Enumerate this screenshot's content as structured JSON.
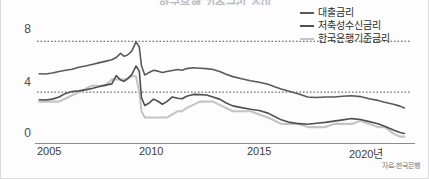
{
  "figure": {
    "title": "한국은행 기준금리 추이",
    "source_note": "자료-한국은행"
  },
  "legend": {
    "position": "top-right",
    "items": [
      {
        "label": "대출금리",
        "color": "#59595b",
        "width": 2
      },
      {
        "label": "저축성수신금리",
        "color": "#4f4f51",
        "width": 2
      },
      {
        "label": "한국은행기준금리",
        "color": "#c2c4c6",
        "width": 2
      }
    ]
  },
  "axes": {
    "y_ticks": [
      "8",
      "4",
      "0"
    ],
    "y_tick_values": [
      8,
      4,
      0
    ],
    "x_ticks": [
      "2005",
      "2010",
      "2015",
      "2020년"
    ],
    "x_tick_values": [
      2005,
      2010,
      2015,
      2020
    ],
    "ylim": [
      0,
      9.2
    ],
    "xlim": [
      2004.3,
      2021.3
    ],
    "grid": "horizontal-dotted-at-4-and-8"
  },
  "chart_data": {
    "type": "line",
    "title": "한국은행 기준금리 추이",
    "xlabel": "",
    "ylabel": "",
    "unit": "%",
    "ylim": [
      0,
      9.2
    ],
    "xlim": [
      2004.3,
      2021.3
    ],
    "grid": true,
    "legend_position": "top-right",
    "x": [
      2004.4,
      2004.7,
      2005.0,
      2005.3,
      2005.6,
      2005.9,
      2006.2,
      2006.5,
      2006.8,
      2007.1,
      2007.4,
      2007.7,
      2007.9,
      2008.1,
      2008.25,
      2008.4,
      2008.6,
      2008.8,
      2008.95,
      2009.05,
      2009.2,
      2009.4,
      2009.6,
      2009.8,
      2010.0,
      2010.2,
      2010.45,
      2010.7,
      2010.9,
      2011.1,
      2011.4,
      2011.7,
      2012.0,
      2012.3,
      2012.6,
      2012.9,
      2013.2,
      2013.6,
      2014.0,
      2014.4,
      2014.8,
      2015.1,
      2015.4,
      2015.8,
      2016.2,
      2016.6,
      2017.0,
      2017.4,
      2017.8,
      2018.2,
      2018.6,
      2019.0,
      2019.4,
      2019.8,
      2020.1,
      2020.5,
      2020.8,
      2021.0
    ],
    "series": [
      {
        "name": "대출금리",
        "color": "#59595b",
        "values": [
          5.45,
          5.42,
          5.5,
          5.62,
          5.72,
          5.8,
          5.95,
          6.05,
          6.18,
          6.3,
          6.42,
          6.55,
          6.72,
          7.05,
          6.82,
          6.9,
          7.2,
          7.95,
          7.55,
          6.05,
          5.35,
          5.55,
          5.72,
          5.65,
          5.55,
          5.62,
          5.7,
          5.78,
          5.72,
          5.85,
          5.92,
          5.88,
          5.85,
          5.78,
          5.62,
          5.4,
          5.22,
          5.05,
          4.9,
          4.78,
          4.62,
          4.42,
          4.25,
          4.05,
          3.85,
          3.62,
          3.58,
          3.62,
          3.62,
          3.68,
          3.72,
          3.65,
          3.48,
          3.35,
          3.2,
          3.05,
          2.9,
          2.75
        ]
      },
      {
        "name": "저축성수신금리",
        "color": "#4f4f51",
        "values": [
          3.4,
          3.38,
          3.45,
          3.62,
          3.9,
          4.05,
          4.1,
          4.18,
          4.28,
          4.42,
          4.55,
          4.65,
          5.3,
          4.95,
          4.85,
          5.05,
          5.35,
          6.05,
          5.65,
          3.55,
          2.95,
          3.15,
          3.45,
          3.28,
          3.05,
          3.25,
          3.62,
          3.52,
          3.48,
          3.68,
          3.82,
          3.8,
          3.78,
          3.62,
          3.45,
          3.15,
          2.92,
          2.78,
          2.65,
          2.55,
          2.35,
          2.08,
          1.82,
          1.62,
          1.52,
          1.48,
          1.55,
          1.62,
          1.72,
          1.82,
          1.92,
          1.85,
          1.68,
          1.52,
          1.32,
          1.02,
          0.82,
          0.75
        ]
      },
      {
        "name": "한국은행기준금리",
        "color": "#c2c4c6",
        "values": [
          3.25,
          3.25,
          3.25,
          3.25,
          3.5,
          3.75,
          4.0,
          4.25,
          4.5,
          4.5,
          4.5,
          5.0,
          5.0,
          5.0,
          5.0,
          5.0,
          5.25,
          5.25,
          4.0,
          2.5,
          2.0,
          2.0,
          2.0,
          2.0,
          2.0,
          2.0,
          2.25,
          2.5,
          2.5,
          2.75,
          3.0,
          3.25,
          3.25,
          3.25,
          3.0,
          2.75,
          2.5,
          2.5,
          2.5,
          2.25,
          2.0,
          1.75,
          1.5,
          1.5,
          1.5,
          1.25,
          1.25,
          1.25,
          1.5,
          1.5,
          1.5,
          1.75,
          1.5,
          1.25,
          1.25,
          0.75,
          0.5,
          0.5
        ]
      }
    ]
  }
}
